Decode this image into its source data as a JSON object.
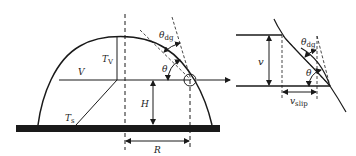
{
  "diagram": {
    "left_panel": {
      "labels": {
        "theta_dg": "θ",
        "theta_dg_sub": "dg",
        "theta": "θ",
        "T_V": "T",
        "T_V_sub": "V",
        "V": "V",
        "H": "H",
        "T_s": "T",
        "T_s_sub": "s",
        "R": "R"
      }
    },
    "right_panel": {
      "labels": {
        "v": "v",
        "theta_dg": "θ",
        "theta_dg_sub": "dg",
        "theta": "θ",
        "v_slip": "v",
        "v_slip_sub": "slip"
      }
    },
    "colors": {
      "stroke": "#1a1a1a",
      "substrate": "#1a1a1a",
      "background": "#ffffff"
    }
  }
}
